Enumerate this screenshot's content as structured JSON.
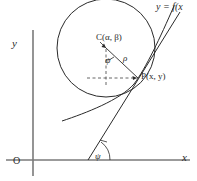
{
  "figure": {
    "type": "geometry-diagram",
    "background_color": "#ffffff",
    "stroke_color": "#2a2a2a",
    "width": 197,
    "height": 181
  },
  "axes": {
    "y_label": "y",
    "x_label": "x",
    "origin_label": "O",
    "origin_px": {
      "x": 33,
      "y": 160
    },
    "x_axis": {
      "x1": 6,
      "y1": 160,
      "x2": 190,
      "y2": 160
    },
    "y_axis": {
      "x1": 33,
      "y1": 30,
      "x2": 33,
      "y2": 176
    }
  },
  "labels": {
    "center": "C(α, β)",
    "point": "P(x, y)",
    "radius": "ρ",
    "angle_at_center": "ψ",
    "angle_at_axis": "ψ",
    "curve": "y = f(x"
  },
  "geometry": {
    "circle": {
      "cx": 106,
      "cy": 48,
      "r": 49,
      "name": "circle-of-curvature"
    },
    "center_point": {
      "x": 106,
      "y": 48
    },
    "tangent_point": {
      "x": 138,
      "y": 78
    },
    "radius_segment": {
      "x1": 106,
      "y1": 48,
      "x2": 138,
      "y2": 78
    },
    "dashed_vertical": {
      "x1": 106,
      "y1": 48,
      "x2": 106,
      "y2": 86
    },
    "dashed_horizontal": {
      "x1": 88,
      "y1": 78,
      "x2": 138,
      "y2": 78
    },
    "tangent_line": {
      "x1": 88,
      "y1": 160,
      "x2": 178,
      "y2": 14
    },
    "tangent_axis_intersection": {
      "x": 88,
      "y": 160
    },
    "curve_path": "M 63,118 C 92,108 124,96 138,78 C 148,64 160,36 172,8",
    "arc_at_center_radius": 11,
    "arc_at_axis_radius": 22
  },
  "colors": {
    "stroke": "#2a2a2a",
    "axis": "#6e6e6e",
    "dashed": "#555555",
    "text": "#2a2a2a"
  }
}
